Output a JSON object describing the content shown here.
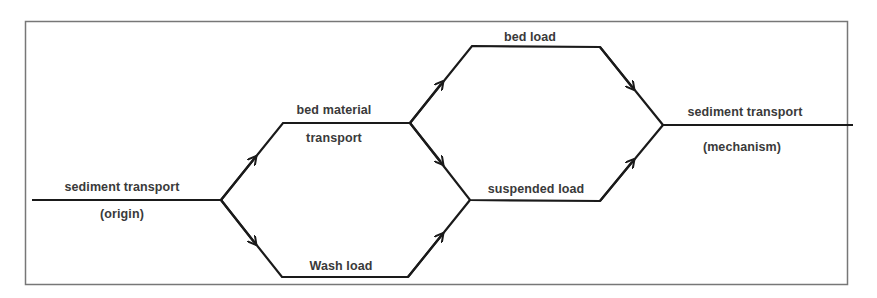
{
  "diagram": {
    "type": "flow",
    "labels": {
      "origin_title": "sediment transport",
      "origin_sub": "(origin)",
      "bed_material_1": "bed material",
      "bed_material_2": "transport",
      "wash_load": "Wash load",
      "bed_load": "bed load",
      "suspended_load": "suspended load",
      "mechanism_title": "sediment transport",
      "mechanism_sub": "(mechanism)"
    },
    "colors": {
      "line": "#1a1a1a",
      "frame": "#777777",
      "text": "#3a3a3a"
    }
  }
}
